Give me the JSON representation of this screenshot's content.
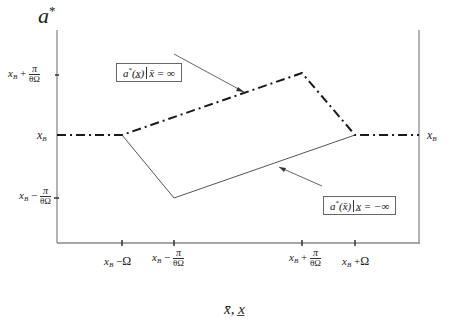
{
  "diagram": {
    "y_axis_label": "a",
    "y_axis_label_sup": "*",
    "x_axis_label": "x̄, x̲",
    "y_ticks": [
      {
        "id": "upper",
        "base": "x",
        "sub": "B",
        "op": "+",
        "num": "π",
        "den": "θΩ",
        "y": 75
      },
      {
        "id": "mid",
        "base": "x",
        "sub": "B",
        "y": 135
      },
      {
        "id": "lower",
        "base": "x",
        "sub": "B",
        "op": "−",
        "num": "π",
        "den": "θΩ",
        "y": 198
      }
    ],
    "right_label": {
      "base": "x",
      "sub": "B"
    },
    "x_ticks": [
      {
        "id": "xb-minus-omega",
        "base": "x",
        "sub": "B",
        "op": "−",
        "tail": "Ω",
        "x": 122
      },
      {
        "id": "xb-minus-pi",
        "base": "x",
        "sub": "B",
        "op": "−",
        "num": "π",
        "den": "θΩ",
        "x": 174
      },
      {
        "id": "xb-plus-pi",
        "base": "x",
        "sub": "B",
        "op": "+",
        "num": "π",
        "den": "θΩ",
        "x": 302
      },
      {
        "id": "xb-plus-omega",
        "base": "x",
        "sub": "B",
        "op": "+",
        "tail": "Ω",
        "x": 355
      }
    ],
    "legend_upper": {
      "func": "a",
      "sup": "*",
      "arg": "(x̲)",
      "cond": "x̄ = ∞"
    },
    "legend_lower": {
      "func": "a",
      "sup": "*",
      "arg": "(x̄)",
      "cond": "x̲ = −∞"
    },
    "curves": [
      {
        "name": "a*(x̲) | x̄=∞",
        "style": "dash-dot",
        "points": [
          [
            57,
            135
          ],
          [
            122,
            135
          ],
          [
            302,
            73
          ],
          [
            355,
            135
          ],
          [
            419,
            135
          ]
        ]
      },
      {
        "name": "a*(x̄) | x̲=−∞",
        "style": "solid",
        "points": [
          [
            122,
            135
          ],
          [
            174,
            198
          ],
          [
            355,
            135
          ]
        ]
      }
    ],
    "colors": {
      "axis": "#8a8a8a",
      "curve": "#1a1a1a",
      "solid_curve": "#555555",
      "box_border": "#666666"
    }
  }
}
